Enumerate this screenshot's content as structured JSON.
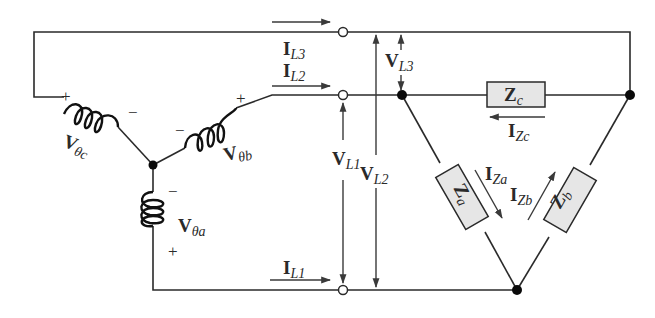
{
  "diagram": {
    "source": {
      "phases": [
        {
          "main": "V",
          "sub": "θa",
          "plus": "+",
          "minus": "−"
        },
        {
          "main": "V",
          "sub": "θb",
          "plus": "+",
          "minus": "−"
        },
        {
          "main": "V",
          "sub": "θc",
          "plus": "+",
          "minus": "−"
        }
      ]
    },
    "line_currents": [
      {
        "main": "I",
        "sub": "L1"
      },
      {
        "main": "I",
        "sub": "L2"
      },
      {
        "main": "I",
        "sub": "L3"
      }
    ],
    "line_voltages": [
      {
        "main": "V",
        "sub": "L1"
      },
      {
        "main": "V",
        "sub": "L2"
      },
      {
        "main": "V",
        "sub": "L3"
      }
    ],
    "load": {
      "impedances": [
        {
          "main": "Z",
          "sub": "a"
        },
        {
          "main": "Z",
          "sub": "b"
        },
        {
          "main": "Z",
          "sub": "c"
        }
      ],
      "currents": [
        {
          "main": "I",
          "sub": "Za"
        },
        {
          "main": "I",
          "sub": "Zb"
        },
        {
          "main": "I",
          "sub": "Zc"
        }
      ]
    },
    "colors": {
      "wire": "#2a2a2a",
      "impedance_fill": "#e6e6e6",
      "background": "#ffffff"
    }
  }
}
